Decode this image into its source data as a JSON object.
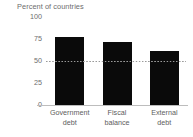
{
  "chart_data": {
    "type": "bar",
    "title": "Percent of countries",
    "xlabel": "",
    "ylabel": "Percent of countries",
    "categories": [
      "Government debt",
      "Fiscal balance",
      "External debt"
    ],
    "category_lines": [
      [
        "Government",
        "debt"
      ],
      [
        "Fiscal",
        "balance"
      ],
      [
        "External",
        "debt"
      ]
    ],
    "values": [
      76,
      71,
      61
    ],
    "ylim": [
      0,
      100
    ],
    "yticks": [
      0,
      25,
      50,
      75,
      100
    ],
    "ytick_labels": [
      "0",
      "25",
      "50",
      "75",
      "100"
    ],
    "grid": false,
    "legend": "none",
    "bar_color": "#0a0a0a",
    "axis_color": "#bdbdbd",
    "text_color": "#6d6d6d",
    "reference_line": {
      "value": 50,
      "style": "dotted",
      "color": "#9a9a9a"
    },
    "annotations": []
  }
}
